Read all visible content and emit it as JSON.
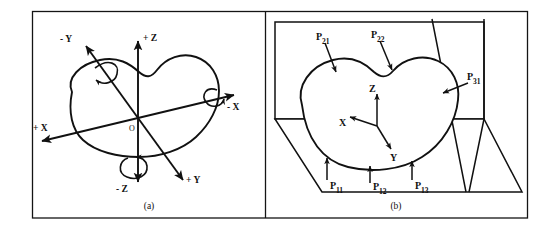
{
  "figure": {
    "panels": [
      {
        "id": "a",
        "caption": "(a)",
        "origin_label": "O",
        "axis_labels": {
          "plus_z": "+ Z",
          "minus_z": "- Z",
          "plus_x": "+ X",
          "minus_x": "- X",
          "plus_y": "+ Y",
          "minus_y": "- Y"
        }
      },
      {
        "id": "b",
        "caption": "(b)",
        "axis_labels": {
          "x": "X",
          "y": "Y",
          "z": "Z"
        },
        "callouts": [
          {
            "name": "P11",
            "base": "P",
            "sub": "11"
          },
          {
            "name": "P12",
            "base": "P",
            "sub": "12"
          },
          {
            "name": "P13",
            "base": "P",
            "sub": "13"
          },
          {
            "name": "P21",
            "base": "P",
            "sub": "21"
          },
          {
            "name": "P22",
            "base": "P",
            "sub": "22"
          },
          {
            "name": "P31",
            "base": "P",
            "sub": "31"
          }
        ]
      }
    ],
    "colors": {
      "ink": "#111111",
      "frame": "#141414",
      "paper": "#ffffff"
    }
  }
}
